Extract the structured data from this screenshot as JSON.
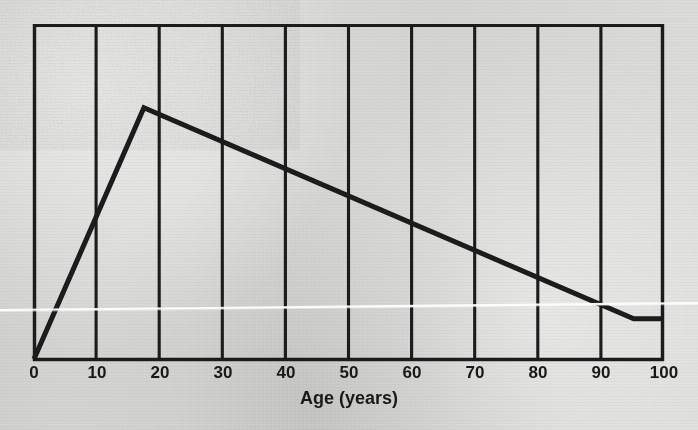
{
  "figure": {
    "background_color": "#d6d6d4",
    "ink_color": "#1a1a1a",
    "media": "scanned-print"
  },
  "chart_data": {
    "type": "line",
    "title": "",
    "subtitle": "",
    "xlabel": "Age (years)",
    "ylabel": "",
    "xlim": [
      0,
      100
    ],
    "ylim": [
      0,
      1
    ],
    "grid": "vertical-only",
    "legend": "none",
    "x_ticks": [
      0,
      10,
      20,
      30,
      40,
      50,
      60,
      70,
      80,
      90,
      100
    ],
    "x_tick_labels": [
      "0",
      "10",
      "20",
      "30",
      "40",
      "50",
      "60",
      "70",
      "80",
      "90",
      "100"
    ],
    "y_ticks": [],
    "y_tick_labels": [],
    "series": [
      {
        "name": "curve",
        "line_color": "#1a1a1a",
        "line_width": 5,
        "points": [
          {
            "x": 0,
            "y": 0.0
          },
          {
            "x": 17.5,
            "y": 0.75
          },
          {
            "x": 95.5,
            "y": 0.12
          },
          {
            "x": 100,
            "y": 0.12
          }
        ]
      }
    ],
    "annotations": [
      {
        "kind": "scan-artifact",
        "name": "white-scan-line",
        "description": "thin white horizontal scanning streak crossing the figure"
      }
    ]
  },
  "axis": {
    "x_title": "Age (years)"
  }
}
